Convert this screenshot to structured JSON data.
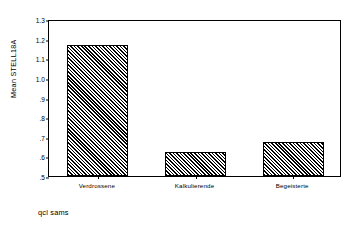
{
  "chart_data": {
    "type": "bar",
    "title": "",
    "subtitle": "",
    "categories": [
      "Verdrossene",
      "Kalkulierende",
      "Begeisterte"
    ],
    "values": [
      1.17,
      0.62,
      0.675
    ],
    "xlabel": "",
    "ylabel": "Mean STELL18A",
    "ylim": [
      0.5,
      1.3
    ],
    "yticks": [
      "1.3",
      "1.2",
      "1.1",
      "1.0",
      ".9",
      ".8",
      ".7",
      ".6",
      ".5"
    ],
    "ytick_values": [
      1.3,
      1.2,
      1.1,
      1.0,
      0.9,
      0.8,
      0.7,
      0.6,
      0.5
    ],
    "grid": false,
    "legend": null,
    "bar_fill": "diagonal-hatch",
    "bar_color": "#000000",
    "background": "#ffffff"
  },
  "caption": {
    "text": "qcl sams"
  }
}
